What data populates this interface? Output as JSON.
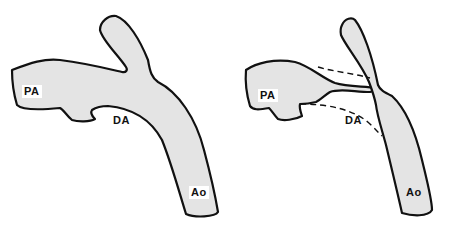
{
  "figure": {
    "panels": [
      {
        "id": "left",
        "description": "Normal anatomy with patent ductus arteriosus",
        "labels": {
          "pa": "PA",
          "da": "DA",
          "ao": "Ao"
        }
      },
      {
        "id": "right",
        "description": "Constricted ductus with dashed outline of original contour",
        "labels": {
          "pa": "PA",
          "da": "DA",
          "ao": "Ao"
        }
      }
    ],
    "colors": {
      "vessel_fill": "#e4e4e4",
      "outline": "#111111",
      "background": "#ffffff"
    }
  }
}
